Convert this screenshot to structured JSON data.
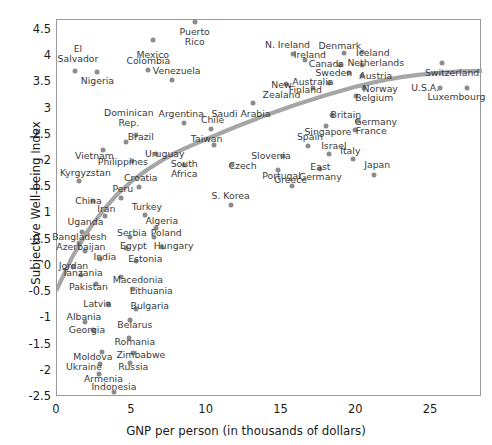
{
  "axes": {
    "x_title": "GNP per person (in thousands of dollars)",
    "y_title": "Subjective Well-being Index",
    "x_ticks": [
      "0",
      "5",
      "10",
      "15",
      "20",
      "25"
    ],
    "y_ticks": [
      "4.5",
      "4",
      "3.5",
      "3",
      "2.5",
      "2",
      "1.5",
      "1",
      "0.5",
      "0",
      "-0.5",
      "-1",
      "-1.5",
      "-2",
      "-2.5"
    ]
  },
  "style": {
    "point_color": "#8c8c8c",
    "curve_color": "#a6a6a6",
    "frame_color": "#9a9a9a",
    "label_color": "#3a3a3a"
  },
  "chart_data": {
    "type": "scatter",
    "title": "",
    "xlabel": "GNP per person (in thousands of dollars)",
    "ylabel": "Subjective Well-being Index",
    "xlim": [
      0,
      28.4
    ],
    "ylim": [
      -2.5,
      4.69
    ],
    "grid": false,
    "legend": "none",
    "x_tick_values": [
      0,
      5,
      10,
      15,
      20,
      25
    ],
    "y_tick_values": [
      4.5,
      4,
      3.5,
      3,
      2.5,
      2,
      1.5,
      1,
      0.5,
      0,
      -0.5,
      -1,
      -1.5,
      -2,
      -2.5
    ],
    "points": [
      {
        "label": "Puerto\nRico",
        "x": 9.2,
        "y": 4.65,
        "lx": 9.2,
        "ly": 4.36
      },
      {
        "label": "Mexico",
        "x": 6.4,
        "y": 4.3,
        "lx": 6.4,
        "ly": 4.03
      },
      {
        "label": "El\nSalvador",
        "x": 1.2,
        "y": 3.72,
        "lx": 1.4,
        "ly": 4.05
      },
      {
        "label": "Colombia",
        "x": 6.1,
        "y": 3.74,
        "lx": 6.1,
        "ly": 3.9
      },
      {
        "label": "Nigeria",
        "x": 2.7,
        "y": 3.7,
        "lx": 2.7,
        "ly": 3.52
      },
      {
        "label": "Venezuela",
        "x": 7.7,
        "y": 3.55,
        "lx": 8.0,
        "ly": 3.72
      },
      {
        "label": "N. Ireland",
        "x": 15.8,
        "y": 4.04,
        "lx": 15.4,
        "ly": 4.22
      },
      {
        "label": "Ireland",
        "x": 16.6,
        "y": 3.93,
        "lx": 16.9,
        "ly": 4.02
      },
      {
        "label": "Denmark",
        "x": 19.2,
        "y": 4.06,
        "lx": 18.9,
        "ly": 4.19
      },
      {
        "label": "Iceland",
        "x": 20.4,
        "y": 4.08,
        "lx": 21.1,
        "ly": 4.07
      },
      {
        "label": "Canada",
        "x": 18.9,
        "y": 3.83,
        "lx": 18.0,
        "ly": 3.85
      },
      {
        "label": "Netherlands",
        "x": 20.4,
        "y": 3.83,
        "lx": 21.3,
        "ly": 3.87
      },
      {
        "label": "Switzerland",
        "x": 25.7,
        "y": 3.87,
        "lx": 26.4,
        "ly": 3.67
      },
      {
        "label": "Sweden",
        "x": 19.5,
        "y": 3.68,
        "lx": 18.5,
        "ly": 3.67
      },
      {
        "label": "Austria",
        "x": 20.4,
        "y": 3.62,
        "lx": 21.3,
        "ly": 3.62
      },
      {
        "label": "Australia",
        "x": 18.2,
        "y": 3.49,
        "lx": 17.1,
        "ly": 3.5
      },
      {
        "label": "New\nZealand",
        "x": 15.3,
        "y": 3.47,
        "lx": 15.0,
        "ly": 3.35
      },
      {
        "label": "Finland",
        "x": 17.1,
        "y": 3.39,
        "lx": 16.6,
        "ly": 3.36
      },
      {
        "label": "U.S.A.",
        "x": 25.6,
        "y": 3.4,
        "lx": 24.6,
        "ly": 3.4
      },
      {
        "label": "Luxembourg",
        "x": 27.4,
        "y": 3.4,
        "lx": 26.7,
        "ly": 3.23
      },
      {
        "label": "Norway",
        "x": 20.5,
        "y": 3.4,
        "lx": 21.6,
        "ly": 3.37
      },
      {
        "label": "Belgium",
        "x": 20.0,
        "y": 3.25,
        "lx": 21.2,
        "ly": 3.2
      },
      {
        "label": "Saudi Arabia",
        "x": 13.1,
        "y": 3.1,
        "lx": 12.3,
        "ly": 2.9
      },
      {
        "label": "Britain",
        "x": 18.4,
        "y": 2.88,
        "lx": 19.3,
        "ly": 2.88
      },
      {
        "label": "Germany",
        "x": 20.1,
        "y": 2.76,
        "lx": 21.3,
        "ly": 2.74
      },
      {
        "label": "Singapore",
        "x": 18.0,
        "y": 2.66,
        "lx": 18.1,
        "ly": 2.55
      },
      {
        "label": "France",
        "x": 19.9,
        "y": 2.6,
        "lx": 21.0,
        "ly": 2.58
      },
      {
        "label": "Argentina",
        "x": 8.5,
        "y": 2.72,
        "lx": 8.3,
        "ly": 2.9
      },
      {
        "label": "Chile",
        "x": 10.3,
        "y": 2.62,
        "lx": 10.4,
        "ly": 2.78
      },
      {
        "label": "Dominican\nRep.",
        "x": 5.3,
        "y": 2.5,
        "lx": 4.8,
        "ly": 2.82
      },
      {
        "label": "Brazil",
        "x": 4.6,
        "y": 2.36,
        "lx": 5.6,
        "ly": 2.46
      },
      {
        "label": "Taiwan",
        "x": 10.5,
        "y": 2.3,
        "lx": 10.0,
        "ly": 2.43
      },
      {
        "label": "Spain",
        "x": 16.8,
        "y": 2.28,
        "lx": 16.9,
        "ly": 2.45
      },
      {
        "label": "Israel",
        "x": 18.2,
        "y": 2.14,
        "lx": 18.5,
        "ly": 2.28
      },
      {
        "label": "Vietnam",
        "x": 3.1,
        "y": 2.22,
        "lx": 2.5,
        "ly": 2.1
      },
      {
        "label": "Uruguay",
        "x": 6.6,
        "y": 2.13,
        "lx": 7.2,
        "ly": 2.13
      },
      {
        "label": "Italy",
        "x": 19.8,
        "y": 2.04,
        "lx": 19.6,
        "ly": 2.2
      },
      {
        "label": "Slovenia",
        "x": 15.1,
        "y": 2.1,
        "lx": 14.3,
        "ly": 2.1
      },
      {
        "label": "Philippines",
        "x": 5.0,
        "y": 2.0,
        "lx": 4.4,
        "ly": 1.98
      },
      {
        "label": "South\nAfrica",
        "x": 8.5,
        "y": 1.93,
        "lx": 8.5,
        "ly": 1.85
      },
      {
        "label": "East\nGermany",
        "x": 17.6,
        "y": 1.85,
        "lx": 17.6,
        "ly": 1.8
      },
      {
        "label": "Czech",
        "x": 11.7,
        "y": 1.92,
        "lx": 12.4,
        "ly": 1.9
      },
      {
        "label": "Portugal",
        "x": 14.8,
        "y": 1.82,
        "lx": 15.0,
        "ly": 1.72
      },
      {
        "label": "Japan",
        "x": 21.2,
        "y": 1.74,
        "lx": 21.4,
        "ly": 1.92
      },
      {
        "label": "Kyrgyzstan",
        "x": 1.5,
        "y": 1.62,
        "lx": 1.9,
        "ly": 1.78
      },
      {
        "label": "Croatia",
        "x": 5.5,
        "y": 1.5,
        "lx": 5.6,
        "ly": 1.68
      },
      {
        "label": "Greece",
        "x": 15.7,
        "y": 1.52,
        "lx": 15.6,
        "ly": 1.64
      },
      {
        "label": "Peru",
        "x": 4.3,
        "y": 1.3,
        "lx": 4.4,
        "ly": 1.46
      },
      {
        "label": "China",
        "x": 2.4,
        "y": 1.24,
        "lx": 2.1,
        "ly": 1.24
      },
      {
        "label": "S. Korea",
        "x": 11.6,
        "y": 1.17,
        "lx": 11.6,
        "ly": 1.34
      },
      {
        "label": "Iran",
        "x": 3.2,
        "y": 0.95,
        "lx": 3.3,
        "ly": 1.08
      },
      {
        "label": "Turkey",
        "x": 5.9,
        "y": 0.98,
        "lx": 6.0,
        "ly": 1.12
      },
      {
        "label": "Uganda",
        "x": 1.7,
        "y": 0.65,
        "lx": 1.9,
        "ly": 0.83
      },
      {
        "label": "Algeria",
        "x": 6.6,
        "y": 0.72,
        "lx": 7.0,
        "ly": 0.86
      },
      {
        "label": "Serbia",
        "x": 4.9,
        "y": 0.56,
        "lx": 5.0,
        "ly": 0.62
      },
      {
        "label": "Bangladesh",
        "x": 1.5,
        "y": 0.44,
        "lx": 1.5,
        "ly": 0.56
      },
      {
        "label": "Poland",
        "x": 6.5,
        "y": 0.55,
        "lx": 7.3,
        "ly": 0.62
      },
      {
        "label": "Egypt",
        "x": 4.6,
        "y": 0.34,
        "lx": 5.1,
        "ly": 0.38
      },
      {
        "label": "Hungary",
        "x": 7.0,
        "y": 0.36,
        "lx": 7.8,
        "ly": 0.38
      },
      {
        "label": "Azerbaijan",
        "x": 1.9,
        "y": 0.28,
        "lx": 1.6,
        "ly": 0.36
      },
      {
        "label": "India",
        "x": 2.9,
        "y": 0.13,
        "lx": 3.2,
        "ly": 0.17
      },
      {
        "label": "Estonia",
        "x": 5.3,
        "y": 0.1,
        "lx": 5.9,
        "ly": 0.14
      },
      {
        "label": "Jordan",
        "x": 1.1,
        "y": -0.02,
        "lx": 1.1,
        "ly": 0.0
      },
      {
        "label": "Tanzania",
        "x": 1.6,
        "y": -0.17,
        "lx": 1.7,
        "ly": -0.13
      },
      {
        "label": "Macedonia",
        "x": 4.3,
        "y": -0.22,
        "lx": 5.4,
        "ly": -0.26
      },
      {
        "label": "Pakistan",
        "x": 2.6,
        "y": -0.35,
        "lx": 2.1,
        "ly": -0.4
      },
      {
        "label": "Lithuania",
        "x": 5.1,
        "y": -0.44,
        "lx": 6.3,
        "ly": -0.48
      },
      {
        "label": "Latvia",
        "x": 3.4,
        "y": -0.72,
        "lx": 2.7,
        "ly": -0.72
      },
      {
        "label": "Bulgaria",
        "x": 5.3,
        "y": -0.82,
        "lx": 6.2,
        "ly": -0.76
      },
      {
        "label": "Albania",
        "x": 1.9,
        "y": -1.07,
        "lx": 1.8,
        "ly": -0.97
      },
      {
        "label": "Belarus",
        "x": 4.9,
        "y": -1.04,
        "lx": 5.2,
        "ly": -1.12
      },
      {
        "label": "Georgia",
        "x": 2.4,
        "y": -1.22,
        "lx": 2.0,
        "ly": -1.22
      },
      {
        "label": "Romania",
        "x": 4.8,
        "y": -1.38,
        "lx": 5.2,
        "ly": -1.45
      },
      {
        "label": "Moldova",
        "x": 3.0,
        "y": -1.64,
        "lx": 2.4,
        "ly": -1.73
      },
      {
        "label": "Zimbabwe",
        "x": 5.1,
        "y": -1.67,
        "lx": 5.6,
        "ly": -1.7
      },
      {
        "label": "Ukraine",
        "x": 2.9,
        "y": -1.87,
        "lx": 1.8,
        "ly": -1.93
      },
      {
        "label": "Russia",
        "x": 4.9,
        "y": -1.85,
        "lx": 5.1,
        "ly": -1.93
      },
      {
        "label": "Armenia",
        "x": 2.8,
        "y": -2.06,
        "lx": 3.1,
        "ly": -2.16
      },
      {
        "label": "Indonesia",
        "x": 3.8,
        "y": -2.4,
        "lx": 3.8,
        "ly": -2.3
      }
    ],
    "trend_curve": {
      "description": "logarithmic best-fit curve rising steeply at low GNP then flattening",
      "points": [
        {
          "x": 0.0,
          "y": -0.44
        },
        {
          "x": 1.0,
          "y": 0.16
        },
        {
          "x": 2.0,
          "y": 0.64
        },
        {
          "x": 3.0,
          "y": 1.03
        },
        {
          "x": 4.0,
          "y": 1.36
        },
        {
          "x": 5.0,
          "y": 1.62
        },
        {
          "x": 6.0,
          "y": 1.83
        },
        {
          "x": 7.0,
          "y": 2.01
        },
        {
          "x": 8.0,
          "y": 2.17
        },
        {
          "x": 9.0,
          "y": 2.3
        },
        {
          "x": 10.0,
          "y": 2.42
        },
        {
          "x": 11.0,
          "y": 2.54
        },
        {
          "x": 12.0,
          "y": 2.66
        },
        {
          "x": 13.0,
          "y": 2.77
        },
        {
          "x": 14.0,
          "y": 2.88
        },
        {
          "x": 15.0,
          "y": 2.98
        },
        {
          "x": 16.0,
          "y": 3.08
        },
        {
          "x": 17.0,
          "y": 3.17
        },
        {
          "x": 18.0,
          "y": 3.26
        },
        {
          "x": 19.0,
          "y": 3.34
        },
        {
          "x": 20.0,
          "y": 3.42
        },
        {
          "x": 21.0,
          "y": 3.49
        },
        {
          "x": 22.0,
          "y": 3.55
        },
        {
          "x": 23.0,
          "y": 3.6
        },
        {
          "x": 24.0,
          "y": 3.64
        },
        {
          "x": 25.0,
          "y": 3.67
        },
        {
          "x": 26.0,
          "y": 3.69
        },
        {
          "x": 27.0,
          "y": 3.71
        },
        {
          "x": 28.4,
          "y": 3.72
        }
      ]
    }
  }
}
